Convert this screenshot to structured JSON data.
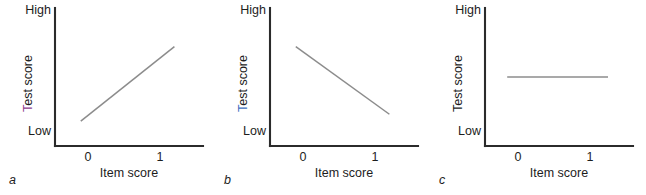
{
  "figure": {
    "width": 646,
    "height": 195,
    "background": "#ffffff",
    "axis_color": "#2b2b2b",
    "trend_color": "#8c8c8c",
    "text_color": "#1d1d1d"
  },
  "chart_data": [
    {
      "type": "line",
      "panel": "a",
      "panel_letter": "a",
      "title": "",
      "xlabel": "Item score",
      "ylabel": "Test score",
      "ylabel_initial": "T",
      "ylabel_initial_color": "#8f3f8f",
      "ylabel_rest": "est score",
      "xticks": [
        "0",
        "1"
      ],
      "xtick_values": [
        0,
        1
      ],
      "ytick_labels": [
        "High",
        "Low"
      ],
      "ylim_labels": {
        "top": "High",
        "bottom": "Low"
      },
      "grid": false,
      "legend": false,
      "relationship": "positive",
      "series": [
        {
          "name": "item-test relationship",
          "x": [
            -0.1,
            1.2
          ],
          "y": [
            0.18,
            0.72
          ],
          "color": "#8c8c8c"
        }
      ],
      "annotation": "Positive discrimination: test score rises with item score"
    },
    {
      "type": "line",
      "panel": "b",
      "panel_letter": "b",
      "title": "",
      "xlabel": "Item score",
      "ylabel": "Test score",
      "ylabel_initial": "T",
      "ylabel_initial_color": "#3f6fbf",
      "ylabel_rest": "est score",
      "xticks": [
        "0",
        "1"
      ],
      "xtick_values": [
        0,
        1
      ],
      "ytick_labels": [
        "High",
        "Low"
      ],
      "ylim_labels": {
        "top": "High",
        "bottom": "Low"
      },
      "grid": false,
      "legend": false,
      "relationship": "negative",
      "series": [
        {
          "name": "item-test relationship",
          "x": [
            -0.1,
            1.2
          ],
          "y": [
            0.72,
            0.23
          ],
          "color": "#8c8c8c"
        }
      ],
      "annotation": "Negative discrimination: test score falls as item score rises"
    },
    {
      "type": "line",
      "panel": "c",
      "panel_letter": "c",
      "title": "",
      "xlabel": "Item score",
      "ylabel": "Test score",
      "ylabel_initial": "T",
      "ylabel_initial_color": "#1d1d1d",
      "ylabel_rest": "est score",
      "xticks": [
        "0",
        "1"
      ],
      "xtick_values": [
        0,
        1
      ],
      "ytick_labels": [
        "High",
        "Low"
      ],
      "ylim_labels": {
        "top": "High",
        "bottom": "Low"
      },
      "grid": false,
      "legend": false,
      "relationship": "flat",
      "series": [
        {
          "name": "item-test relationship",
          "x": [
            -0.15,
            1.25
          ],
          "y": [
            0.5,
            0.5
          ],
          "color": "#8c8c8c"
        }
      ],
      "annotation": "Zero discrimination: test score unrelated to item score"
    }
  ]
}
